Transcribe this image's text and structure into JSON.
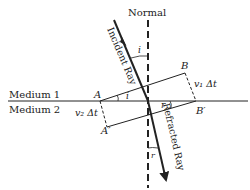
{
  "diagram": {
    "type": "refraction-huygens",
    "labels": {
      "normal": "Normal",
      "incident_ray": "Incident Ray",
      "refracted_ray": "Refracted Ray",
      "medium1": "Medium 1",
      "medium2": "Medium 2",
      "point_A": "A",
      "point_B": "B",
      "point_B_prime": "B′",
      "point_A_prime": "A′",
      "angle_i": "i",
      "angle_i_wave": "i",
      "angle_r": "r",
      "angle_r_wave": "r",
      "v1_dt": "v₁ Δt",
      "v2_dt": "v₂ Δt"
    },
    "colors": {
      "line": "#222222",
      "background": "#ffffff"
    }
  }
}
